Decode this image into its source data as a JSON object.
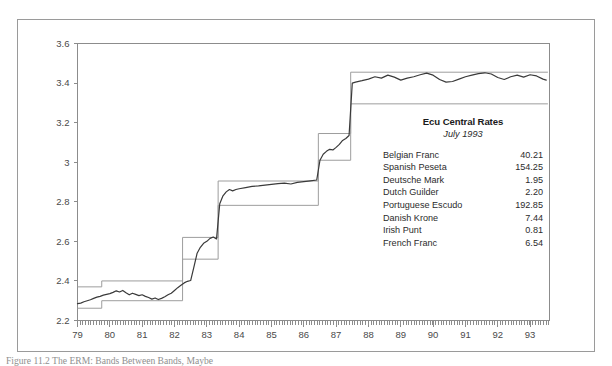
{
  "chart_data": {
    "type": "line",
    "title": "",
    "xlabel": "",
    "ylabel": "",
    "xlim": [
      79,
      93.6
    ],
    "ylim": [
      2.2,
      3.6
    ],
    "grid": false,
    "legend_position": "inside-right",
    "y_ticks": [
      "3.6",
      "3.4",
      "3.2",
      "3",
      "2.8",
      "2.6",
      "2.4",
      "2.2"
    ],
    "y_tick_values": [
      3.6,
      3.4,
      3.2,
      3.0,
      2.8,
      2.6,
      2.4,
      2.2
    ],
    "x_ticks": [
      "79",
      "80",
      "81",
      "82",
      "83",
      "84",
      "85",
      "86",
      "87",
      "88",
      "89",
      "90",
      "91",
      "92",
      "93"
    ],
    "x_tick_values": [
      79,
      80,
      81,
      82,
      83,
      84,
      85,
      86,
      87,
      88,
      89,
      90,
      91,
      92,
      93
    ],
    "minor_tick_interval": 0.0833,
    "series": [
      {
        "name": "Market exchange rate",
        "style": "solid-dark",
        "x": [
          79.0,
          79.1,
          79.2,
          79.3,
          79.4,
          79.5,
          79.6,
          79.7,
          79.8,
          79.9,
          80.0,
          80.1,
          80.2,
          80.3,
          80.4,
          80.5,
          80.6,
          80.7,
          80.8,
          80.9,
          81.0,
          81.1,
          81.2,
          81.3,
          81.4,
          81.5,
          81.6,
          81.7,
          81.8,
          81.9,
          82.0,
          82.1,
          82.2,
          82.3,
          82.4,
          82.5,
          82.6,
          82.7,
          82.8,
          82.9,
          83.0,
          83.1,
          83.2,
          83.3,
          83.4,
          83.5,
          83.6,
          83.7,
          83.8,
          83.9,
          84.0,
          84.2,
          84.4,
          84.6,
          84.8,
          85.0,
          85.2,
          85.4,
          85.6,
          85.8,
          86.0,
          86.2,
          86.4,
          86.5,
          86.6,
          86.7,
          86.8,
          86.9,
          87.0,
          87.1,
          87.2,
          87.3,
          87.4,
          87.5,
          87.6,
          87.8,
          88.0,
          88.2,
          88.4,
          88.6,
          88.8,
          89.0,
          89.2,
          89.4,
          89.6,
          89.8,
          90.0,
          90.2,
          90.4,
          90.6,
          90.8,
          91.0,
          91.2,
          91.4,
          91.6,
          91.8,
          92.0,
          92.2,
          92.4,
          92.6,
          92.8,
          93.0,
          93.2,
          93.4,
          93.5
        ],
        "y": [
          2.285,
          2.288,
          2.295,
          2.3,
          2.305,
          2.312,
          2.318,
          2.322,
          2.328,
          2.332,
          2.336,
          2.342,
          2.35,
          2.344,
          2.352,
          2.34,
          2.33,
          2.338,
          2.332,
          2.326,
          2.33,
          2.322,
          2.316,
          2.308,
          2.314,
          2.306,
          2.312,
          2.32,
          2.33,
          2.338,
          2.352,
          2.366,
          2.378,
          2.39,
          2.398,
          2.402,
          2.47,
          2.54,
          2.57,
          2.59,
          2.6,
          2.615,
          2.622,
          2.612,
          2.79,
          2.83,
          2.85,
          2.862,
          2.855,
          2.862,
          2.866,
          2.872,
          2.878,
          2.88,
          2.884,
          2.888,
          2.892,
          2.894,
          2.89,
          2.898,
          2.902,
          2.906,
          2.91,
          3.01,
          3.04,
          3.055,
          3.065,
          3.062,
          3.075,
          3.09,
          3.11,
          3.12,
          3.135,
          3.4,
          3.405,
          3.412,
          3.42,
          3.432,
          3.425,
          3.44,
          3.43,
          3.415,
          3.425,
          3.432,
          3.442,
          3.45,
          3.44,
          3.418,
          3.405,
          3.408,
          3.42,
          3.432,
          3.44,
          3.448,
          3.452,
          3.446,
          3.428,
          3.418,
          3.432,
          3.44,
          3.43,
          3.442,
          3.436,
          3.42,
          3.415
        ]
      },
      {
        "name": "Upper band limit",
        "style": "step-light",
        "steps": [
          {
            "x_start": 79.0,
            "x_end": 79.75,
            "y": 2.37
          },
          {
            "x_start": 79.75,
            "x_end": 82.25,
            "y": 2.4
          },
          {
            "x_start": 82.25,
            "x_end": 83.35,
            "y": 2.62
          },
          {
            "x_start": 83.35,
            "x_end": 86.45,
            "y": 2.905
          },
          {
            "x_start": 86.45,
            "x_end": 87.45,
            "y": 3.145
          },
          {
            "x_start": 87.45,
            "x_end": 93.55,
            "y": 3.455
          }
        ]
      },
      {
        "name": "Lower band limit",
        "style": "step-light",
        "steps": [
          {
            "x_start": 79.0,
            "x_end": 79.75,
            "y": 2.262
          },
          {
            "x_start": 79.75,
            "x_end": 82.25,
            "y": 2.3
          },
          {
            "x_start": 82.25,
            "x_end": 83.35,
            "y": 2.51
          },
          {
            "x_start": 83.35,
            "x_end": 86.45,
            "y": 2.782
          },
          {
            "x_start": 86.45,
            "x_end": 87.45,
            "y": 3.01
          },
          {
            "x_start": 87.45,
            "x_end": 93.55,
            "y": 3.295
          }
        ]
      }
    ],
    "annotation": {
      "title": "Ecu Central Rates",
      "subtitle": "July 1993",
      "rows": [
        {
          "currency": "Belgian Franc",
          "rate": "40.21"
        },
        {
          "currency": "Spanish Peseta",
          "rate": "154.25"
        },
        {
          "currency": "Deutsche Mark",
          "rate": "1.95"
        },
        {
          "currency": "Dutch Guilder",
          "rate": "2.20"
        },
        {
          "currency": "Portuguese Escudo",
          "rate": "192.85"
        },
        {
          "currency": "Danish Krone",
          "rate": "7.44"
        },
        {
          "currency": "Irish Punt",
          "rate": "0.81"
        },
        {
          "currency": "French Franc",
          "rate": "6.54"
        }
      ]
    }
  },
  "caption": {
    "text": "Figure 11.2  The ERM: Bands Between Bands, Maybe"
  },
  "colors": {
    "frame": "#9a9a9a",
    "axis": "#8c8c8c",
    "series": "#3a3a3a",
    "band": "#9d9d9d",
    "text": "#2b2b2b"
  }
}
